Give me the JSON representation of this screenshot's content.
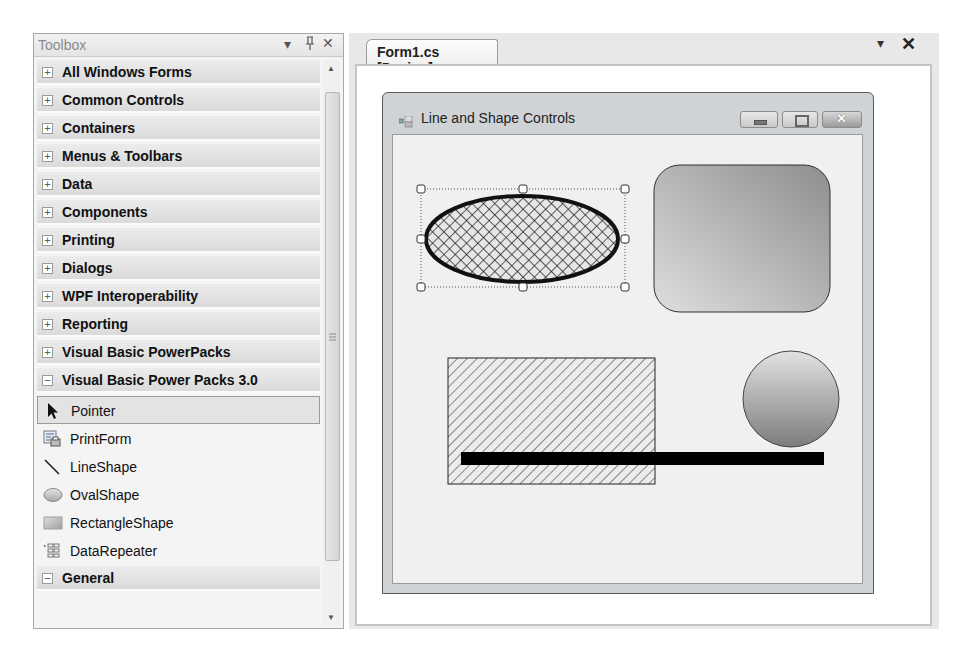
{
  "toolbox": {
    "title": "Toolbox",
    "controls": {
      "dropdown": "▾",
      "pin": "ᵖ",
      "close": "✕"
    },
    "categories": [
      {
        "label": "All Windows Forms",
        "state": "+"
      },
      {
        "label": "Common Controls",
        "state": "+"
      },
      {
        "label": "Containers",
        "state": "+"
      },
      {
        "label": "Menus & Toolbars",
        "state": "+"
      },
      {
        "label": "Data",
        "state": "+"
      },
      {
        "label": "Components",
        "state": "+"
      },
      {
        "label": "Printing",
        "state": "+"
      },
      {
        "label": "Dialogs",
        "state": "+"
      },
      {
        "label": "WPF Interoperability",
        "state": "+"
      },
      {
        "label": "Reporting",
        "state": "+"
      },
      {
        "label": "Visual Basic PowerPacks",
        "state": "+"
      },
      {
        "label": "Visual Basic Power Packs 3.0",
        "state": "−"
      }
    ],
    "items": [
      {
        "label": "Pointer",
        "icon": "pointer-icon",
        "selected": true
      },
      {
        "label": "PrintForm",
        "icon": "printform-icon"
      },
      {
        "label": "LineShape",
        "icon": "line-icon"
      },
      {
        "label": "OvalShape",
        "icon": "oval-icon"
      },
      {
        "label": "RectangleShape",
        "icon": "rectangle-icon"
      },
      {
        "label": "DataRepeater",
        "icon": "datarepeater-icon"
      }
    ],
    "general": {
      "label": "General",
      "state": "−"
    }
  },
  "designer": {
    "tab_label": "Form1.cs [Design]",
    "controls": {
      "dropdown": "▾",
      "close": "✕"
    },
    "form": {
      "title": "Line and Shape Controls",
      "buttons": {
        "minimize": "minimize",
        "maximize": "maximize",
        "close": "close"
      }
    }
  },
  "colors": {
    "line": "#000000",
    "shape_border": "#333333",
    "gradient_light": "#d6d6d6",
    "gradient_dark": "#8a8a8a"
  }
}
